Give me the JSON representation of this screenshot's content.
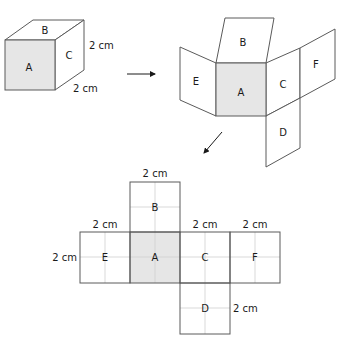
{
  "diagram": {
    "colors": {
      "shaded_face": "#e6e6e6",
      "stroke": "#5a5a5a",
      "grid": "#cfcfcf"
    },
    "cube": {
      "faces": {
        "front": "A",
        "top": "B",
        "right": "C"
      },
      "dims": {
        "height": "2 cm",
        "depth": "2 cm"
      }
    },
    "unfolding": {
      "faces": {
        "center": "A",
        "top": "B",
        "left": "E",
        "right": "C",
        "far_right": "F",
        "bottom": "D"
      }
    },
    "net": {
      "faces": {
        "top": "B",
        "left": "E",
        "center": "A",
        "right": "C",
        "far_right": "F",
        "bottom": "D"
      },
      "dims": {
        "top_b": "2 cm",
        "top_e": "2 cm",
        "left_e": "2 cm",
        "top_c": "2 cm",
        "top_f": "2 cm",
        "right_d": "2 cm"
      }
    }
  }
}
